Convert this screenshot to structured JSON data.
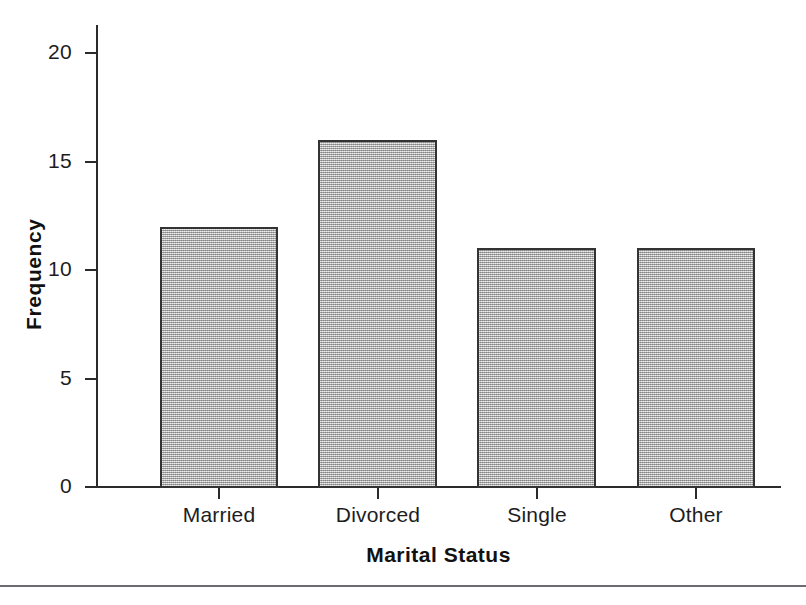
{
  "figure": {
    "background_color": "#ffffff",
    "bottom_rule_color": "#6b6b73"
  },
  "chart_data": {
    "type": "bar",
    "title": "",
    "xlabel": "Marital Status",
    "ylabel": "Frequency",
    "categories": [
      "Married",
      "Divorced",
      "Single",
      "Other"
    ],
    "values": [
      12,
      16,
      11,
      11
    ],
    "ylim": [
      0,
      21.3
    ],
    "yticks": [
      0,
      5,
      10,
      15,
      20
    ],
    "ytick_labels": [
      "0",
      "5",
      "10",
      "15",
      "20"
    ],
    "xtick_labels": [
      "Married",
      "Divorced",
      "Single",
      "Other"
    ],
    "grid": false,
    "legend": false,
    "legend_position": "none",
    "bar_fill_color": "#b4b4b4",
    "bar_fill_pattern": "fine-gray-dither",
    "bar_edge_color": "#333333",
    "axis_color": "#2b2b2b",
    "axis_label_color": "#111111",
    "bars": [
      {
        "category": "Married",
        "value": 12,
        "left": 160,
        "right": 278,
        "top": 227,
        "center": 219
      },
      {
        "category": "Divorced",
        "value": 16,
        "left": 318,
        "right": 437,
        "top": 136,
        "center": 378
      },
      {
        "category": "Single",
        "value": 11,
        "left": 477,
        "right": 596,
        "top": 245,
        "center": 537
      },
      {
        "category": "Other",
        "value": 11,
        "left": 637,
        "right": 755,
        "top": 243,
        "center": 696
      }
    ]
  }
}
